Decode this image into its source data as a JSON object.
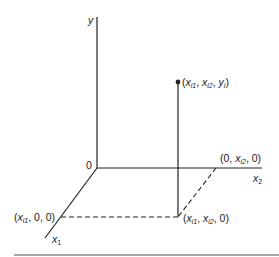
{
  "diagram": {
    "type": "3d-coordinate-axes",
    "axes": {
      "y": {
        "label": "y"
      },
      "x1": {
        "label": "x",
        "sub": "1"
      },
      "x2": {
        "label": "x",
        "sub": "2"
      },
      "origin": {
        "label": "0"
      }
    },
    "points": {
      "data_point": {
        "parts": [
          "(",
          "x",
          "i1",
          ", ",
          "x",
          "i2",
          ", ",
          "y",
          "i",
          ")"
        ]
      },
      "x1_point": {
        "parts": [
          "(",
          "x",
          "i1",
          ", 0, 0)"
        ]
      },
      "x2_point": {
        "parts": [
          "(0, ",
          "x",
          "i2",
          ", 0)"
        ]
      },
      "base_point": {
        "parts": [
          "(",
          "x",
          "i1",
          ", ",
          "x",
          "i2",
          ", 0)"
        ]
      }
    },
    "colors": {
      "line": "#222222",
      "background": "#ffffff"
    }
  }
}
